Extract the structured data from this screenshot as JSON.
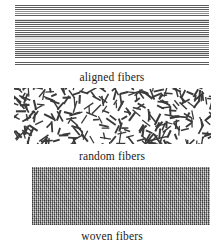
{
  "figure": {
    "background_color": "#ffffff",
    "width": 224,
    "height": 248
  },
  "panels": [
    {
      "id": "aligned",
      "caption": "aligned fibers",
      "texture_name": "aligned-fiber-texture",
      "pattern": "dense parallel horizontal lines",
      "line_color": "#5d5d5d",
      "fill_color": "#f2f2f2",
      "line_pitch_px": 2
    },
    {
      "id": "random",
      "caption": "random fibers",
      "texture_name": "random-fiber-texture",
      "pattern": "short straight segments at random orientations",
      "segment_color": "#3a3a3a",
      "fill_color": "#ffffff",
      "segment_length_px": 9,
      "segment_count": 300
    },
    {
      "id": "woven",
      "caption": "woven fibers",
      "texture_name": "woven-fiber-texture",
      "pattern": "fine orthogonal over-under weave",
      "weave_color": "#9a9a9a",
      "fill_color": "#9a9a9a",
      "weave_pitch_px": 2
    }
  ],
  "caption_color": "#1b1b1b"
}
